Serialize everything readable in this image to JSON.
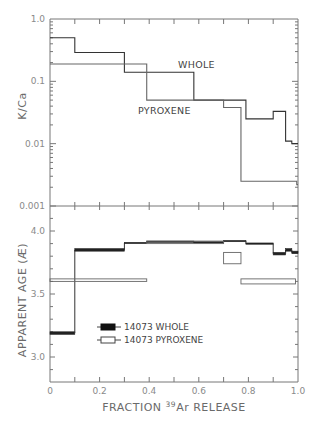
{
  "chart_data": [
    {
      "type": "line",
      "subtype": "step",
      "panel": "top",
      "title": "",
      "xlabel": "",
      "ylabel": "K/Ca",
      "yscale": "log",
      "ylim": [
        0.001,
        1.0
      ],
      "xlim": [
        0,
        1.0
      ],
      "ytick_labels": [
        "1.0",
        "0.1",
        "0.01",
        "0.001"
      ],
      "annotations": [
        "WHOLE",
        "PYROXENE"
      ],
      "series": [
        {
          "name": "WHOLE",
          "steps": [
            {
              "x0": 0.0,
              "x1": 0.1,
              "y": 0.5
            },
            {
              "x0": 0.1,
              "x1": 0.3,
              "y": 0.29
            },
            {
              "x0": 0.3,
              "x1": 0.58,
              "y": 0.14
            },
            {
              "x0": 0.58,
              "x1": 0.79,
              "y": 0.05
            },
            {
              "x0": 0.79,
              "x1": 0.9,
              "y": 0.025
            },
            {
              "x0": 0.9,
              "x1": 0.95,
              "y": 0.033
            },
            {
              "x0": 0.95,
              "x1": 0.975,
              "y": 0.011
            },
            {
              "x0": 0.975,
              "x1": 1.0,
              "y": 0.01
            }
          ]
        },
        {
          "name": "PYROXENE",
          "steps": [
            {
              "x0": 0.0,
              "x1": 0.39,
              "y": 0.19
            },
            {
              "x0": 0.39,
              "x1": 0.7,
              "y": 0.05
            },
            {
              "x0": 0.7,
              "x1": 0.77,
              "y": 0.038
            },
            {
              "x0": 0.77,
              "x1": 0.995,
              "y": 0.0025
            },
            {
              "x0": 0.995,
              "x1": 1.0,
              "y": 0.0022
            }
          ]
        }
      ]
    },
    {
      "type": "bar",
      "subtype": "age-spectrum",
      "panel": "bottom",
      "title": "",
      "xlabel": "FRACTION 39Ar RELEASE",
      "ylabel": "APPARENT AGE (Æ)",
      "ylim": [
        2.8,
        4.15
      ],
      "xlim": [
        0,
        1.0
      ],
      "xtick_labels": [
        "0",
        "0.2",
        "0.4",
        "0.6",
        "0.8",
        "1.0"
      ],
      "ytick_labels": [
        "4.0",
        "3.5",
        "3.0"
      ],
      "legend": [
        "14073 WHOLE",
        "14073 PYROXENE"
      ],
      "legend_position": "lower-left",
      "series": [
        {
          "name": "14073 WHOLE",
          "fill": "filled",
          "steps": [
            {
              "x0": 0.0,
              "x1": 0.1,
              "y_lo": 3.18,
              "y_hi": 3.2
            },
            {
              "x0": 0.1,
              "x1": 0.3,
              "y_lo": 3.84,
              "y_hi": 3.86
            },
            {
              "x0": 0.3,
              "x1": 0.39,
              "y_lo": 3.9,
              "y_hi": 3.91
            },
            {
              "x0": 0.39,
              "x1": 0.58,
              "y_lo": 3.91,
              "y_hi": 3.92
            },
            {
              "x0": 0.58,
              "x1": 0.7,
              "y_lo": 3.905,
              "y_hi": 3.915
            },
            {
              "x0": 0.7,
              "x1": 0.79,
              "y_lo": 3.915,
              "y_hi": 3.925
            },
            {
              "x0": 0.79,
              "x1": 0.9,
              "y_lo": 3.895,
              "y_hi": 3.905
            },
            {
              "x0": 0.9,
              "x1": 0.95,
              "y_lo": 3.81,
              "y_hi": 3.83
            },
            {
              "x0": 0.95,
              "x1": 0.975,
              "y_lo": 3.84,
              "y_hi": 3.86
            },
            {
              "x0": 0.975,
              "x1": 1.0,
              "y_lo": 3.82,
              "y_hi": 3.84
            }
          ]
        },
        {
          "name": "14073 PYROXENE",
          "fill": "open",
          "steps": [
            {
              "x0": 0.0,
              "x1": 0.39,
              "y_lo": 3.6,
              "y_hi": 3.62
            },
            {
              "x0": 0.39,
              "x1": 0.7,
              "y_lo": 3.9,
              "y_hi": 3.92
            },
            {
              "x0": 0.7,
              "x1": 0.77,
              "y_lo": 3.74,
              "y_hi": 3.83
            },
            {
              "x0": 0.77,
              "x1": 0.99,
              "y_lo": 3.58,
              "y_hi": 3.62
            }
          ]
        }
      ]
    }
  ],
  "labels": {
    "top_ylabel": "K/Ca",
    "bottom_ylabel": "APPARENT AGE (Æ)",
    "xlabel_prefix": "FRACTION ",
    "xlabel_sup": "39",
    "xlabel_suffix": "Ar  RELEASE",
    "annot_whole": "WHOLE",
    "annot_pyroxene": "PYROXENE",
    "legend_whole": "14073 WHOLE",
    "legend_pyroxene": "14073 PYROXENE",
    "top_yticks": [
      "1.0",
      "0.1",
      "0.01",
      "0.001"
    ],
    "bottom_yticks": [
      "4.0",
      "3.5",
      "3.0"
    ],
    "xticks": [
      "0",
      "0.2",
      "0.4",
      "0.6",
      "0.8",
      "1.0"
    ]
  }
}
